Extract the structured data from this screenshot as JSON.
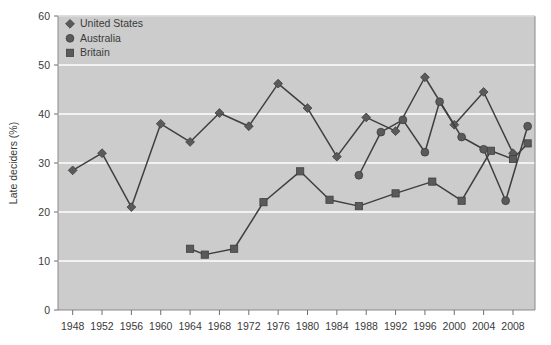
{
  "chart_data": {
    "type": "line",
    "title": "",
    "subtitle": "",
    "xlabel": "",
    "ylabel": "Late deciders (%)",
    "xlim": [
      1946,
      2011
    ],
    "ylim": [
      0,
      60
    ],
    "yticks": [
      0,
      10,
      20,
      30,
      40,
      50,
      60
    ],
    "ytick_labels": [
      "0",
      "10",
      "20",
      "30",
      "40",
      "50",
      "60"
    ],
    "xticks": [
      1948,
      1952,
      1956,
      1960,
      1964,
      1968,
      1972,
      1976,
      1980,
      1984,
      1988,
      1992,
      1996,
      2000,
      2004,
      2008
    ],
    "xtick_labels": [
      "1948",
      "1952",
      "1956",
      "1960",
      "1964",
      "1968",
      "1972",
      "1976",
      "1980",
      "1984",
      "1988",
      "1992",
      "1996",
      "2000",
      "2004",
      "2008"
    ],
    "grid": "horizontal",
    "grid_color": "#ffffff",
    "plot_background": "#cccccc",
    "figure_background": "#ffffff",
    "legend_position": "top-left",
    "series": [
      {
        "name": "United States",
        "marker": "diamond",
        "color": "#5a5a5a",
        "line_color": "#3f3f3f",
        "points": [
          {
            "x": 1948,
            "y": 28.5
          },
          {
            "x": 1952,
            "y": 32.0
          },
          {
            "x": 1956,
            "y": 21.0
          },
          {
            "x": 1960,
            "y": 38.0
          },
          {
            "x": 1964,
            "y": 34.3
          },
          {
            "x": 1968,
            "y": 40.2
          },
          {
            "x": 1972,
            "y": 37.5
          },
          {
            "x": 1976,
            "y": 46.2
          },
          {
            "x": 1980,
            "y": 41.2
          },
          {
            "x": 1984,
            "y": 31.3
          },
          {
            "x": 1988,
            "y": 39.3
          },
          {
            "x": 1992,
            "y": 36.5
          },
          {
            "x": 1996,
            "y": 47.5
          },
          {
            "x": 2000,
            "y": 37.8
          },
          {
            "x": 2004,
            "y": 44.5
          },
          {
            "x": 2008,
            "y": 32.0
          }
        ]
      },
      {
        "name": "Australia",
        "marker": "circle",
        "color": "#5a5a5a",
        "line_color": "#3f3f3f",
        "points": [
          {
            "x": 1987,
            "y": 27.5
          },
          {
            "x": 1990,
            "y": 36.3
          },
          {
            "x": 1993,
            "y": 38.8
          },
          {
            "x": 1996,
            "y": 32.2
          },
          {
            "x": 1998,
            "y": 42.5
          },
          {
            "x": 2001,
            "y": 35.3
          },
          {
            "x": 2004,
            "y": 32.8
          },
          {
            "x": 2007,
            "y": 22.3
          },
          {
            "x": 2010,
            "y": 37.5
          }
        ]
      },
      {
        "name": "Britain",
        "marker": "square",
        "color": "#5a5a5a",
        "line_color": "#3f3f3f",
        "points": [
          {
            "x": 1964,
            "y": 12.5
          },
          {
            "x": 1966,
            "y": 11.3
          },
          {
            "x": 1970,
            "y": 12.5
          },
          {
            "x": 1974,
            "y": 22.0
          },
          {
            "x": 1979,
            "y": 28.3
          },
          {
            "x": 1983,
            "y": 22.5
          },
          {
            "x": 1987,
            "y": 21.2
          },
          {
            "x": 1992,
            "y": 23.8
          },
          {
            "x": 1997,
            "y": 26.2
          },
          {
            "x": 2001,
            "y": 22.3
          },
          {
            "x": 2005,
            "y": 32.5
          },
          {
            "x": 2008,
            "y": 30.8
          },
          {
            "x": 2010,
            "y": 34.0
          }
        ]
      }
    ],
    "legend": [
      {
        "label": "United States",
        "marker": "diamond"
      },
      {
        "label": "Australia",
        "marker": "circle"
      },
      {
        "label": "Britain",
        "marker": "square"
      }
    ]
  }
}
